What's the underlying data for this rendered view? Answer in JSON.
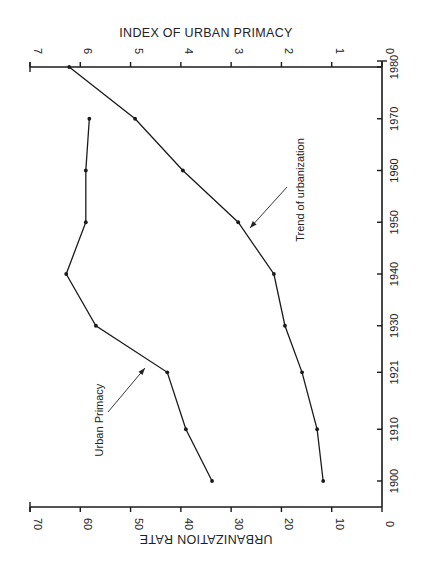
{
  "chart_data": {
    "type": "line",
    "orientation": "rotated 90 degrees clockwise",
    "x": [
      1900,
      1910,
      1921,
      1930,
      1940,
      1950,
      1960,
      1970,
      1980
    ],
    "x_tick_labels": [
      "1900",
      "1910",
      "1921",
      "1930",
      "1940",
      "1950",
      "1960",
      "1970",
      "1980"
    ],
    "series": [
      {
        "name": "Trend of urbanization",
        "axis": "URBANIZATION RATE",
        "x": [
          1900,
          1910,
          1921,
          1930,
          1940,
          1950,
          1960,
          1970,
          1980
        ],
        "values": [
          11.7,
          12.9,
          15.9,
          19.3,
          21.5,
          28.6,
          39.6,
          49.1,
          62.2
        ]
      },
      {
        "name": "Urban Primacy",
        "axis": "INDEX OF URBAN PRIMACY",
        "x": [
          1900,
          1910,
          1921,
          1930,
          1940,
          1950,
          1960,
          1970
        ],
        "values": [
          3.38,
          3.9,
          4.27,
          5.69,
          6.28,
          5.89,
          5.89,
          5.82
        ]
      }
    ],
    "axes": {
      "primary_value_axis": {
        "label": "URBANIZATION RATE",
        "range": [
          0,
          70
        ],
        "ticks": [
          "0",
          "10",
          "20",
          "30",
          "40",
          "50",
          "60",
          "70"
        ]
      },
      "secondary_value_axis": {
        "label": "INDEX OF URBAN PRIMACY",
        "range": [
          0,
          7
        ],
        "ticks": [
          "0",
          "1",
          "2",
          "3",
          "4",
          "5",
          "6",
          "7"
        ]
      },
      "time_axis": {
        "label": "",
        "range": [
          1900,
          1980
        ]
      }
    },
    "annotations": [
      {
        "text": "Urban Primacy",
        "points_to": "Urban Primacy"
      },
      {
        "text": "Trend of urbanization",
        "points_to": "Trend of urbanization"
      }
    ],
    "grid": false,
    "legend": "none (inline arrow annotations)"
  },
  "labels": {
    "top_axis_title": "INDEX OF URBAN PRIMACY",
    "bottom_axis_title": "URBANIZATION RATE",
    "annotation_primacy": "Urban Primacy",
    "annotation_trend": "Trend of urbanization"
  }
}
